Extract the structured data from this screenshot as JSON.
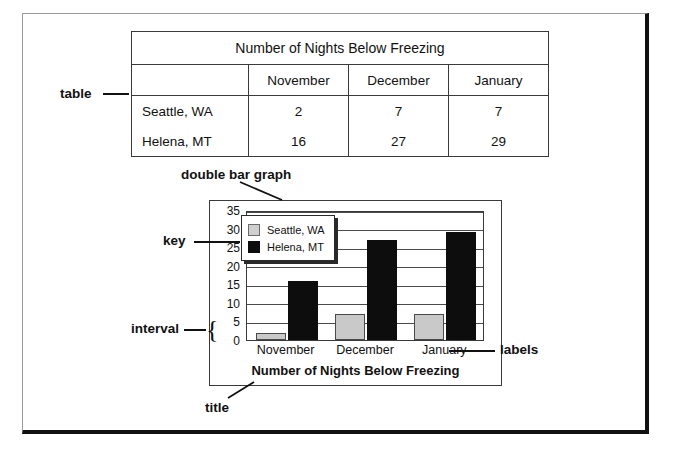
{
  "table": {
    "title": "Number of Nights Below Freezing",
    "column_headers": [
      "",
      "November",
      "December",
      "January"
    ],
    "rows": [
      {
        "label": "Seattle, WA",
        "values": [
          "2",
          "7",
          "7"
        ]
      },
      {
        "label": "Helena, MT",
        "values": [
          "16",
          "27",
          "29"
        ]
      }
    ]
  },
  "annotations": {
    "table": "table",
    "double_bar_graph": "double bar graph",
    "key": "key",
    "interval": "interval",
    "labels": "labels",
    "title": "title",
    "brace": "{"
  },
  "chart_data": {
    "type": "bar",
    "title": "Number of Nights Below Freezing",
    "xlabel": "",
    "ylabel": "",
    "categories": [
      "November",
      "December",
      "January"
    ],
    "series": [
      {
        "name": "Seattle, WA",
        "values": [
          2,
          7,
          7
        ],
        "color": "#c9c9c9"
      },
      {
        "name": "Helena, MT",
        "values": [
          16,
          27,
          29
        ],
        "color": "#0d0d0d"
      }
    ],
    "ylim": [
      0,
      35
    ],
    "ytick_step": 5,
    "yticks": [
      "35",
      "30",
      "25",
      "20",
      "15",
      "10",
      "5",
      "0"
    ],
    "grid": true,
    "legend_position": "top-left"
  },
  "colors": {
    "seattle_bar": "#c9c9c9",
    "helena_bar": "#0d0d0d",
    "frame_dark": "#111111",
    "rule": "#3a3a3a"
  }
}
